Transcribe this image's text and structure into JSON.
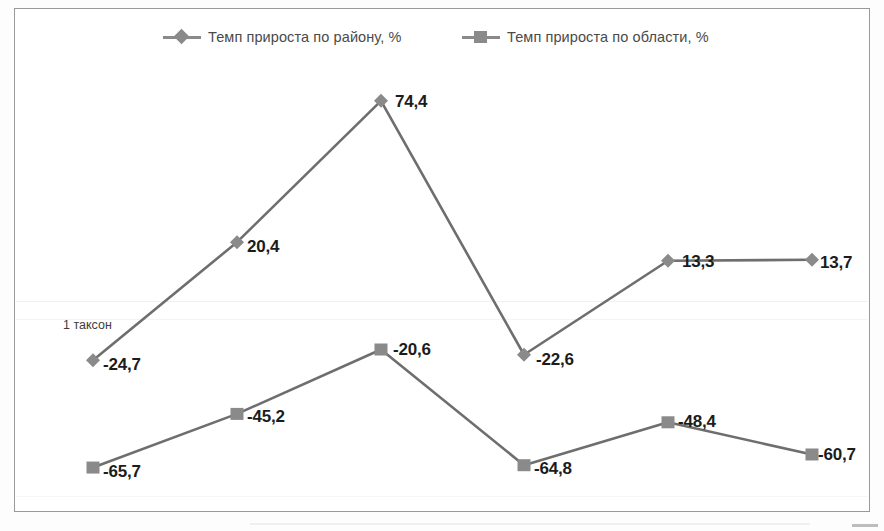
{
  "chart_data": {
    "type": "line",
    "title": "",
    "subtitle": "",
    "xlabel": "",
    "ylabel": "",
    "grid": true,
    "legend_position": "top",
    "categories": [
      "1",
      "2",
      "3",
      "4",
      "5",
      "6"
    ],
    "ylim": [
      -80,
      90
    ],
    "annotations": [
      {
        "text": "1 таксон",
        "x": 63,
        "y": 318
      }
    ],
    "series": [
      {
        "name": "Темп прироста по району, %",
        "marker": "diamond",
        "color": "#8a8a8a",
        "values": [
          -24.7,
          20.4,
          74.4,
          -22.6,
          13.3,
          13.7
        ],
        "labels": [
          "-24,7",
          "20,4",
          "74,4",
          "-22,6",
          "13,3",
          "13,7"
        ]
      },
      {
        "name": "Темп прироста по области, %",
        "marker": "square",
        "color": "#8a8a8a",
        "values": [
          -65.7,
          -45.2,
          -20.6,
          -64.8,
          -48.4,
          -60.7
        ],
        "labels": [
          "-65,7",
          "-45,2",
          "-20,6",
          "-64,8",
          "-48,4",
          "-60,7"
        ]
      }
    ]
  },
  "legend": {
    "items": [
      {
        "label": "Темп прироста по району, %",
        "marker": "diamond"
      },
      {
        "label": "Темп прироста по области, %",
        "marker": "square"
      }
    ]
  },
  "colors": {
    "series_line": "#8a8a8a",
    "series_line_dark": "#6e6e6e",
    "frame_border": "#9a9a9a",
    "label_text": "#1c1c1c",
    "legend_text": "#4a4a4a"
  }
}
